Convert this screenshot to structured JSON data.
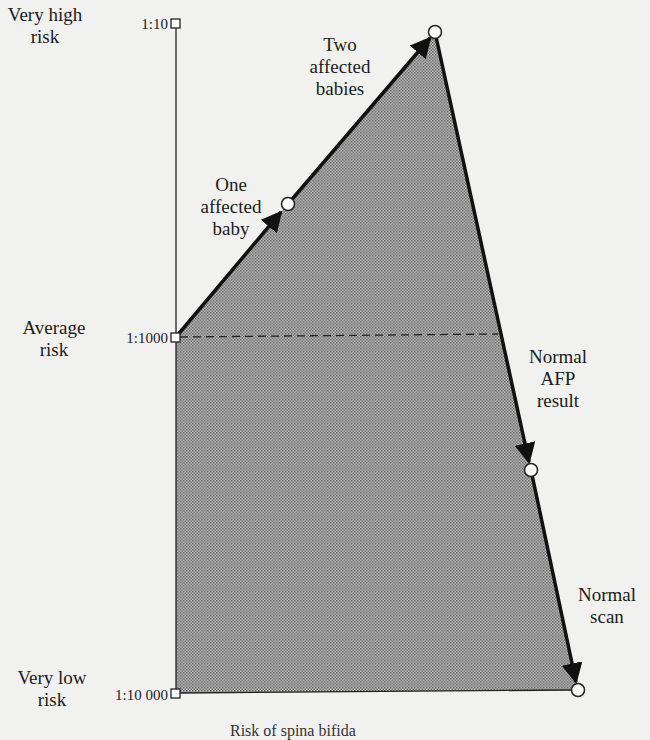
{
  "diagram": {
    "risk_labels": {
      "very_high": "Very high risk",
      "very_high_l1": "Very high",
      "very_high_l2": "risk",
      "average_l1": "Average",
      "average_l2": "risk",
      "very_low_l1": "Very low",
      "very_low_l2": "risk"
    },
    "scale_ticks": [
      "1:10",
      "1:1000",
      "1:10 000"
    ],
    "events": [
      {
        "label_lines": [
          "One",
          "affected",
          "baby"
        ],
        "direction": "up"
      },
      {
        "label_lines": [
          "Two",
          "affected",
          "babies"
        ],
        "direction": "up"
      },
      {
        "label_lines": [
          "Normal",
          "AFP",
          "result"
        ],
        "direction": "down"
      },
      {
        "label_lines": [
          "Normal",
          "scan"
        ],
        "direction": "down"
      }
    ],
    "caption": "Risk of spina bifida",
    "colors": {
      "background": "#f1f1ef",
      "fill": "#9a9a9a",
      "line": "#111111"
    }
  }
}
